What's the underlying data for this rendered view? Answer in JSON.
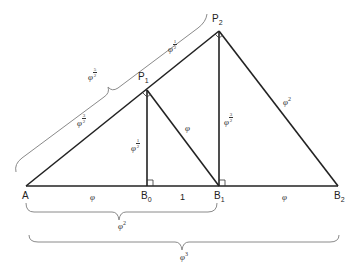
{
  "diagram": {
    "type": "geometric-construction",
    "line_color": "#222222",
    "brace_color": "#888888",
    "points": {
      "A": {
        "label": "A",
        "sub": "",
        "x": 26,
        "y": 186
      },
      "B0": {
        "label": "B",
        "sub": "0",
        "x": 147,
        "y": 186
      },
      "B1": {
        "label": "B",
        "sub": "1",
        "x": 219,
        "y": 186
      },
      "B2": {
        "label": "B",
        "sub": "2",
        "x": 338,
        "y": 186
      },
      "P1": {
        "label": "P",
        "sub": "1",
        "x": 147,
        "y": 90
      },
      "P2": {
        "label": "P",
        "sub": "2",
        "x": 219,
        "y": 31
      }
    },
    "segment_labels": {
      "A_B0": {
        "base": "φ",
        "exp": ""
      },
      "B0_B1": {
        "base": "1",
        "exp": ""
      },
      "B1_B2": {
        "base": "φ",
        "exp": ""
      },
      "A_P1": {
        "base": "φ",
        "num": "3",
        "den": "2"
      },
      "P1_P2": {
        "base": "φ",
        "num": "1",
        "den": "2"
      },
      "P1_B0": {
        "base": "φ",
        "num": "1",
        "den": "2"
      },
      "P1_B1": {
        "base": "φ",
        "exp": ""
      },
      "P2_B1": {
        "base": "φ",
        "num": "3",
        "den": "2"
      },
      "P2_B2": {
        "base": "φ",
        "exp": "2"
      }
    },
    "brace_labels": {
      "A_P2": {
        "base": "φ",
        "num": "5",
        "den": "2"
      },
      "A_B1": {
        "base": "φ",
        "exp": "2"
      },
      "A_B2": {
        "base": "φ",
        "exp": "3"
      }
    },
    "right_angle_marks": [
      "B0",
      "B1",
      "P1",
      "P2"
    ]
  }
}
